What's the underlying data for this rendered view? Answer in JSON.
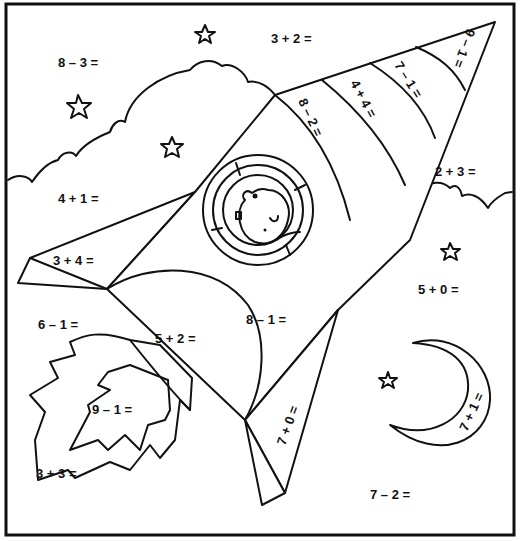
{
  "worksheet": {
    "title": "Rocket color-by-math worksheet",
    "problems": {
      "sky_top_left": "8 – 3 =",
      "sky_top": "3 + 2 =",
      "cloud_left": "4 + 1 =",
      "wing_left": "3 + 4 =",
      "sky_left": "6 – 1 =",
      "rocket_body_lower": "5 + 2 =",
      "rocket_body_middle": "8 – 1 =",
      "flame_inner": "9 – 1 =",
      "flame_outer": "3 + 3 =",
      "fin_bottom": "7 + 0 =",
      "band_1": "8 – 2 =",
      "band_2": "4 + 4 =",
      "band_3": "7 – 1 =",
      "nose_tip": "9 – 1 =",
      "cloud_right": "2 + 3 =",
      "sky_right": "5 + 0 =",
      "moon": "7 + 1 =",
      "sky_bottom_right": "7 – 2 ="
    }
  }
}
